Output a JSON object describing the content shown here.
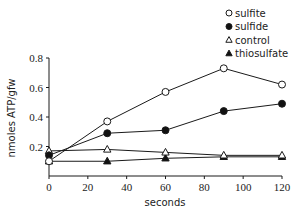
{
  "chart_data": {
    "type": "line",
    "title": "",
    "xlabel": "seconds",
    "ylabel": "nmoles ATP/gfw",
    "x": [
      0,
      30,
      60,
      90,
      120
    ],
    "xlim": [
      0,
      120
    ],
    "ylim": [
      0,
      0.8
    ],
    "xticks": [
      "0",
      "20",
      "40",
      "60",
      "80",
      "100",
      "120"
    ],
    "xtick_values": [
      0,
      20,
      40,
      60,
      80,
      100,
      120
    ],
    "yticks": [
      "0.2",
      "0.4",
      "0.6",
      "0.8"
    ],
    "ytick_values": [
      0.2,
      0.4,
      0.6,
      0.8
    ],
    "grid": false,
    "legend_position": "top-right",
    "series": [
      {
        "name": "sulfite",
        "marker": "open-circle",
        "values": [
          0.1,
          0.37,
          0.57,
          0.73,
          0.62
        ]
      },
      {
        "name": "sulfide",
        "marker": "filled-circle",
        "values": [
          0.14,
          0.29,
          0.31,
          0.44,
          0.49
        ]
      },
      {
        "name": "control",
        "marker": "open-triangle",
        "values": [
          0.17,
          0.18,
          0.16,
          0.14,
          0.14
        ]
      },
      {
        "name": "thiosulfate",
        "marker": "filled-triangle",
        "values": [
          0.1,
          0.1,
          0.12,
          0.13,
          0.13
        ]
      }
    ]
  },
  "legend": {
    "items": [
      {
        "label": "sulfite",
        "symbol": "○"
      },
      {
        "label": "sulfide",
        "symbol": "●"
      },
      {
        "label": "control",
        "symbol": "△"
      },
      {
        "label": "thiosulfate",
        "symbol": "▲"
      }
    ]
  },
  "colors": {
    "line": "#1a1a1a",
    "marker_fill_open": "#ffffff",
    "marker_fill_solid": "#111111"
  }
}
